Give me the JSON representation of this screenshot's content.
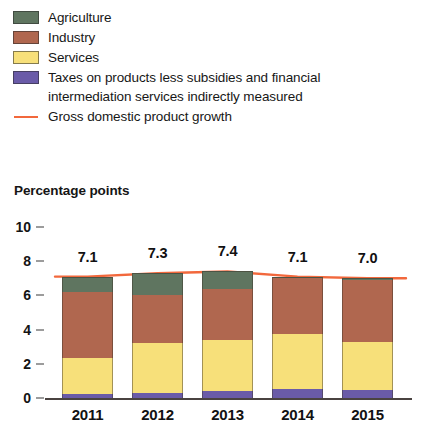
{
  "legend": {
    "items": [
      {
        "label": "Agriculture",
        "color": "#5f7560",
        "marker": "swatch",
        "icon": "legend-swatch-icon"
      },
      {
        "label": "Industry",
        "color": "#b0674f",
        "marker": "swatch",
        "icon": "legend-swatch-icon"
      },
      {
        "label": "Services",
        "color": "#f7e07a",
        "marker": "swatch",
        "icon": "legend-swatch-icon"
      },
      {
        "label": "Taxes on products less subsidies and financial intermediation services indirectly measured",
        "color": "#6a5ba8",
        "marker": "swatch",
        "icon": "legend-swatch-icon"
      },
      {
        "label": "Gross domestic product growth",
        "color": "#f2683c",
        "marker": "line",
        "icon": "legend-line-icon"
      }
    ]
  },
  "chart_data": {
    "type": "bar",
    "stacked": true,
    "title": "",
    "subtitle": "",
    "ylabel": "Percentage points",
    "xlabel": "",
    "categories": [
      "2011",
      "2012",
      "2013",
      "2014",
      "2015"
    ],
    "ylim": [
      0,
      10
    ],
    "yticks": [
      0,
      2,
      4,
      6,
      8,
      10
    ],
    "ytick_labels": [
      "0",
      "2",
      "4",
      "6",
      "8",
      "10"
    ],
    "grid": false,
    "legend_position": "top-left",
    "series": [
      {
        "name": "Taxes on products less subsidies and financial intermediation services indirectly measured",
        "color": "#6a5ba8",
        "values": [
          0.25,
          0.3,
          0.4,
          0.55,
          0.45
        ]
      },
      {
        "name": "Services",
        "color": "#f7e07a",
        "values": [
          2.1,
          2.9,
          3.0,
          3.2,
          2.8
        ]
      },
      {
        "name": "Industry",
        "color": "#b0674f",
        "values": [
          3.85,
          2.8,
          3.0,
          3.25,
          3.65
        ]
      },
      {
        "name": "Agriculture",
        "color": "#5f7560",
        "values": [
          0.9,
          1.3,
          1.0,
          0.1,
          0.1
        ]
      }
    ],
    "overlay_line": {
      "name": "Gross domestic product growth",
      "color": "#f2683c",
      "values": [
        7.1,
        7.3,
        7.4,
        7.1,
        7.0
      ]
    },
    "bar_labels": [
      "7.1",
      "7.3",
      "7.4",
      "7.1",
      "7.0"
    ]
  }
}
